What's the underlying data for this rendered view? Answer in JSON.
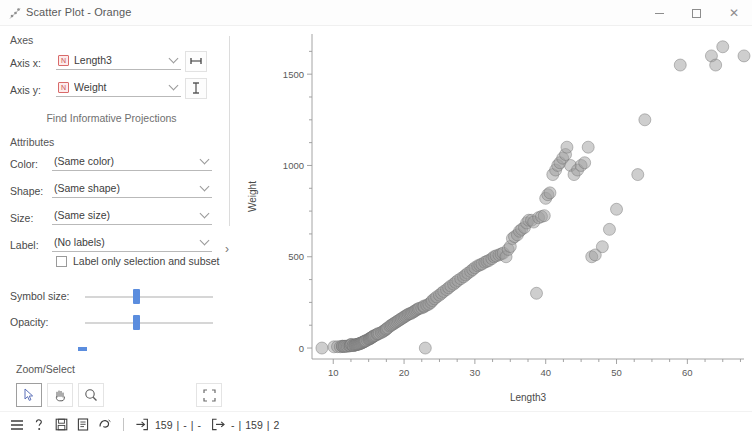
{
  "window": {
    "title": "Scatter Plot - Orange",
    "icon": "scatter-plot-icon",
    "minimize_label": "",
    "maximize_label": "",
    "close_label": "✕"
  },
  "panel": {
    "axes_group": "Axes",
    "axis_x_label": "Axis x:",
    "axis_x_value": "Length3",
    "axis_x_badge": "N",
    "axis_x_button_icon": "horizontal-axis-icon",
    "axis_y_label": "Axis y:",
    "axis_y_value": "Weight",
    "axis_y_badge": "N",
    "axis_y_button_icon": "vertical-axis-icon",
    "find_projections": "Find Informative Projections",
    "attributes_group": "Attributes",
    "color_label": "Color:",
    "color_value": "(Same color)",
    "shape_label": "Shape:",
    "shape_value": "(Same shape)",
    "size_label": "Size:",
    "size_value": "(Same size)",
    "label_label": "Label:",
    "label_value": "(No labels)",
    "label_only_checkbox": "Label only selection and subset",
    "label_only_checked": false,
    "symbol_size_label": "Symbol size:",
    "symbol_size_value": 45,
    "opacity_label": "Opacity:",
    "opacity_value": 50,
    "zoom_select_group": "Zoom/Select",
    "tools": [
      {
        "name": "select-tool",
        "icon": "cursor-arrow-icon",
        "active": true
      },
      {
        "name": "pan-tool",
        "icon": "hand-icon",
        "active": false
      },
      {
        "name": "zoom-tool",
        "icon": "magnifier-icon",
        "active": false
      }
    ],
    "reset_tool": {
      "name": "reset-zoom-tool",
      "icon": "expand-icon"
    },
    "send_automatically": "Send Automatically",
    "send_automatically_checked": true,
    "splitter_arrow": "›"
  },
  "statusbar": {
    "icons": [
      "menu-icon",
      "help-icon",
      "save-icon",
      "report-icon",
      "clipboard-icon"
    ],
    "input_icon": "input-arrow-icon",
    "input_count": "159",
    "input_sep1": "|",
    "input_dash1": "-",
    "input_sep2": "|",
    "input_dash2": "-",
    "output_icon": "output-arrow-icon",
    "output_dash": "-",
    "output_sep1": "|",
    "output_count": "159",
    "output_sep2": "|",
    "output_extra": "2"
  },
  "chart_data": {
    "type": "scatter",
    "title": "",
    "xlabel": "Length3",
    "ylabel": "Weight",
    "xlim": [
      7,
      68
    ],
    "ylim": [
      -60,
      1720
    ],
    "xticks": [
      10,
      20,
      30,
      40,
      50,
      60
    ],
    "yticks": [
      0,
      500,
      1000,
      1500
    ],
    "grid": false,
    "legend": false,
    "point_color": "#9e9e9e",
    "point_edge_color": "#6e6e6e",
    "point_opacity": 0.5,
    "point_radius": 6,
    "n_points": 159,
    "series": [
      {
        "name": "Fish",
        "x": [
          8.4,
          10.1,
          10.6,
          11.0,
          11.3,
          11.3,
          11.5,
          11.6,
          11.8,
          12.0,
          12.2,
          12.4,
          12.4,
          12.5,
          12.6,
          12.8,
          12.8,
          13.0,
          13.1,
          13.2,
          13.3,
          13.4,
          13.5,
          13.6,
          13.7,
          13.8,
          13.9,
          14.0,
          14.1,
          14.2,
          14.3,
          14.4,
          14.5,
          14.6,
          14.8,
          15.0,
          15.1,
          15.2,
          15.3,
          15.4,
          15.5,
          15.6,
          15.7,
          15.8,
          16.0,
          16.2,
          16.3,
          16.5,
          16.8,
          17.0,
          17.2,
          17.4,
          17.5,
          17.7,
          18.0,
          18.2,
          18.4,
          18.6,
          18.8,
          19.0,
          19.2,
          19.4,
          19.6,
          19.8,
          20.0,
          20.2,
          20.4,
          20.6,
          20.8,
          21.0,
          21.2,
          21.4,
          21.6,
          21.8,
          22.0,
          22.2,
          22.5,
          22.8,
          23.0,
          22.8,
          23.2,
          23.5,
          23.8,
          24.0,
          24.3,
          24.6,
          25.0,
          25.3,
          25.6,
          26.0,
          26.3,
          26.6,
          27.0,
          27.3,
          27.6,
          28.0,
          28.4,
          28.7,
          29.0,
          29.4,
          29.7,
          30.0,
          30.4,
          30.7,
          31.0,
          31.4,
          31.7,
          32.0,
          32.4,
          32.7,
          33.0,
          33.4,
          33.7,
          34.0,
          34.4,
          34.7,
          35.0,
          35.3,
          35.6,
          36.0,
          36.3,
          36.6,
          37.0,
          37.3,
          37.6,
          38.0,
          38.3,
          38.7,
          39.0,
          39.4,
          39.8,
          40.0,
          40.3,
          40.6,
          41.0,
          41.4,
          41.7,
          42.0,
          42.4,
          42.8,
          43.0,
          43.5,
          44.0,
          44.5,
          45.0,
          45.5,
          46.0,
          46.5,
          47.0,
          48.0,
          49.0,
          50.0,
          53.0,
          54.0,
          59.0,
          63.4,
          64.0,
          65.0,
          68.0
        ],
        "y": [
          0,
          6.7,
          7.5,
          7.0,
          9.7,
          9.8,
          8.7,
          10.0,
          9.9,
          9.8,
          12.2,
          13.4,
          12.2,
          19.7,
          19.9,
          13.4,
          14.0,
          15.0,
          17.0,
          18.0,
          19.5,
          20.0,
          21.0,
          22.0,
          23.5,
          25.0,
          26.5,
          28.0,
          30.0,
          32.0,
          34.0,
          36.0,
          38.0,
          40.0,
          44.0,
          48.0,
          50.0,
          52.0,
          55.0,
          57.0,
          60.0,
          62.0,
          65.0,
          68.0,
          70.0,
          75.0,
          78.0,
          80.0,
          85.0,
          90.0,
          95.0,
          100.0,
          105.0,
          110.0,
          120.0,
          125.0,
          130.0,
          135.0,
          140.0,
          145.0,
          150.0,
          155.0,
          160.0,
          165.0,
          170.0,
          175.0,
          180.0,
          185.0,
          188.0,
          190.0,
          195.0,
          200.0,
          205.0,
          210.0,
          215.0,
          218.0,
          220.0,
          225.0,
          0.0,
          230.0,
          235.0,
          240.0,
          250.0,
          260.0,
          270.0,
          280.0,
          290.0,
          300.0,
          310.0,
          320.0,
          330.0,
          340.0,
          350.0,
          360.0,
          370.0,
          380.0,
          390.0,
          400.0,
          410.0,
          420.0,
          430.0,
          440.0,
          450.0,
          455.0,
          460.0,
          470.0,
          475.0,
          480.0,
          490.0,
          500.0,
          505.0,
          510.0,
          515.0,
          520.0,
          500.0,
          540.0,
          556.0,
          600.0,
          610.0,
          620.0,
          640.0,
          650.0,
          660.0,
          685.0,
          700.0,
          700.0,
          690.0,
          300.0,
          714.0,
          720.0,
          725.0,
          820.0,
          840.0,
          850.0,
          950.0,
          975.0,
          1000.0,
          1015.0,
          1040.0,
          1060.0,
          1100.0,
          1000.0,
          950.0,
          975.0,
          1000.0,
          1015.0,
          1100.0,
          500.0,
          510.0,
          555.0,
          650.0,
          760.0,
          950.0,
          1250.0,
          1550.0,
          1600.0,
          1550.0,
          1650.0,
          1600.0
        ]
      }
    ]
  }
}
